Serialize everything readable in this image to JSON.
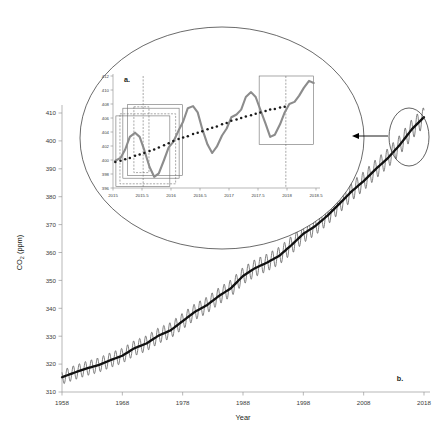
{
  "figure": {
    "panel_a_label": "a.",
    "panel_b_label": "b.",
    "annotation": {
      "magnifier_shape": "ellipse",
      "callout_shape": "ellipse",
      "arrow": "arrow-left"
    }
  },
  "chart_data": [
    {
      "id": "main",
      "panel": "b.",
      "type": "line",
      "title": "",
      "xlabel": "Year",
      "ylabel": "CO2 (ppm)",
      "ylabel_display": "CO₂ (ppm)",
      "xlim": [
        1958,
        2018
      ],
      "ylim": [
        310,
        410
      ],
      "xticks": [
        1958,
        1968,
        1978,
        1988,
        1998,
        2008,
        2018
      ],
      "yticks": [
        310,
        320,
        330,
        340,
        350,
        360,
        370,
        380,
        390,
        400,
        410
      ],
      "grid": false,
      "legend": "none",
      "series": [
        {
          "name": "Monthly mean CO2 (Mauna Loa)",
          "color": "#555555",
          "style": "sawtooth-seasonal",
          "seasonal_amplitude_ppm": 3.0,
          "annual_trend": {
            "x": [
              1958,
              1960,
              1962,
              1964,
              1966,
              1968,
              1970,
              1972,
              1974,
              1976,
              1978,
              1980,
              1982,
              1984,
              1986,
              1988,
              1990,
              1992,
              1994,
              1996,
              1998,
              2000,
              2002,
              2004,
              2006,
              2008,
              2010,
              2012,
              2014,
              2016,
              2018,
              2019
            ],
            "y": [
              315.3,
              316.9,
              318.4,
              319.6,
              321.4,
              323.0,
              325.7,
              327.4,
              330.2,
              332.1,
              335.4,
              338.7,
              341.1,
              344.4,
              347.2,
              351.6,
              354.4,
              356.4,
              358.8,
              362.6,
              366.7,
              369.5,
              373.2,
              377.5,
              381.9,
              385.6,
              389.9,
              393.8,
              398.6,
              404.2,
              408.5,
              411.4
            ]
          }
        }
      ]
    },
    {
      "id": "inset",
      "panel": "a.",
      "type": "line",
      "title": "",
      "xlabel": "",
      "ylabel": "",
      "xlim": [
        2015,
        2018.5
      ],
      "ylim": [
        396,
        412
      ],
      "xticks": [
        2015,
        2015.5,
        2016,
        2016.5,
        2017,
        2017.5,
        2018,
        2018.5
      ],
      "xtick_labels": [
        "2015",
        "2015.5",
        "2016",
        "2016.5",
        "2017",
        "2017.5",
        "2018",
        "2018.5"
      ],
      "yticks": [
        396,
        398,
        400,
        402,
        404,
        406,
        408,
        410,
        412
      ],
      "grid": false,
      "legend": "none",
      "series": [
        {
          "name": "Monthly mean CO2",
          "color": "#8c8c8c",
          "style": "solid-thick",
          "x": [
            2015.04,
            2015.13,
            2015.21,
            2015.29,
            2015.38,
            2015.46,
            2015.54,
            2015.63,
            2015.71,
            2015.79,
            2015.88,
            2015.96,
            2016.04,
            2016.13,
            2016.21,
            2016.29,
            2016.38,
            2016.46,
            2016.54,
            2016.63,
            2016.71,
            2016.79,
            2016.88,
            2016.96,
            2017.04,
            2017.13,
            2017.21,
            2017.29,
            2017.38,
            2017.46,
            2017.54,
            2017.63,
            2017.71,
            2017.79,
            2017.88,
            2017.96,
            2018.04,
            2018.13,
            2018.21,
            2018.29,
            2018.38,
            2018.46
          ],
          "y": [
            399.9,
            400.3,
            401.5,
            403.3,
            403.9,
            403.3,
            401.4,
            399.0,
            397.6,
            398.1,
            400.0,
            401.8,
            402.6,
            404.2,
            405.5,
            407.4,
            407.7,
            406.8,
            404.4,
            402.2,
            401.0,
            401.9,
            403.5,
            404.5,
            406.1,
            406.5,
            407.2,
            409.0,
            409.7,
            409.0,
            407.2,
            405.2,
            403.3,
            403.6,
            405.1,
            406.8,
            408.0,
            408.3,
            409.2,
            410.3,
            411.3,
            411.0
          ]
        },
        {
          "name": "Trend (dotted)",
          "color": "#1a1a1a",
          "style": "dotted-markers",
          "x": [
            2015.04,
            2015.13,
            2015.21,
            2015.29,
            2015.38,
            2015.46,
            2015.54,
            2015.63,
            2015.71,
            2015.79,
            2015.88,
            2015.96,
            2016.04,
            2016.13,
            2016.21,
            2016.29,
            2016.38,
            2016.46,
            2016.54,
            2016.63,
            2016.71,
            2016.79,
            2016.88,
            2016.96,
            2017.04,
            2017.13,
            2017.21,
            2017.29,
            2017.38,
            2017.46,
            2017.54,
            2017.63,
            2017.71,
            2017.79,
            2017.88,
            2017.96
          ],
          "y": [
            399.7,
            399.9,
            400.1,
            400.3,
            400.6,
            400.8,
            401.0,
            401.3,
            401.5,
            401.8,
            402.1,
            402.4,
            402.7,
            403.0,
            403.2,
            403.4,
            403.7,
            403.9,
            404.1,
            404.4,
            404.6,
            404.8,
            405.1,
            405.3,
            405.6,
            405.8,
            406.0,
            406.2,
            406.4,
            406.6,
            406.8,
            407.0,
            407.2,
            407.3,
            407.5,
            407.6
          ]
        }
      ],
      "annotations": {
        "boxes": [
          {
            "name": "window-box-1",
            "x0": 2015.05,
            "x1": 2015.98,
            "y0": 396.2,
            "y1": 406.3,
            "dashed": false
          },
          {
            "name": "window-box-2",
            "x0": 2015.12,
            "x1": 2016.08,
            "y0": 396.6,
            "y1": 406.6,
            "dashed": true
          },
          {
            "name": "window-box-3",
            "x0": 2015.17,
            "x1": 2016.14,
            "y0": 397.4,
            "y1": 407.4,
            "dashed": false
          },
          {
            "name": "window-box-4",
            "x0": 2015.25,
            "x1": 2016.2,
            "y0": 397.8,
            "y1": 407.9,
            "dashed": false
          },
          {
            "name": "window-box-5",
            "x0": 2015.36,
            "x1": 2015.62,
            "y0": 398.2,
            "y1": 407.6,
            "dashed": true
          },
          {
            "name": "forecast-box",
            "x0": 2017.52,
            "x1": 2018.46,
            "y0": 402.2,
            "y1": 412.0,
            "dashed": false
          }
        ],
        "vlines": [
          {
            "name": "divider-line-left",
            "x": 2015.52,
            "dashed": true
          },
          {
            "name": "divider-line-right",
            "x": 2017.98,
            "dashed": true
          }
        ]
      }
    }
  ]
}
